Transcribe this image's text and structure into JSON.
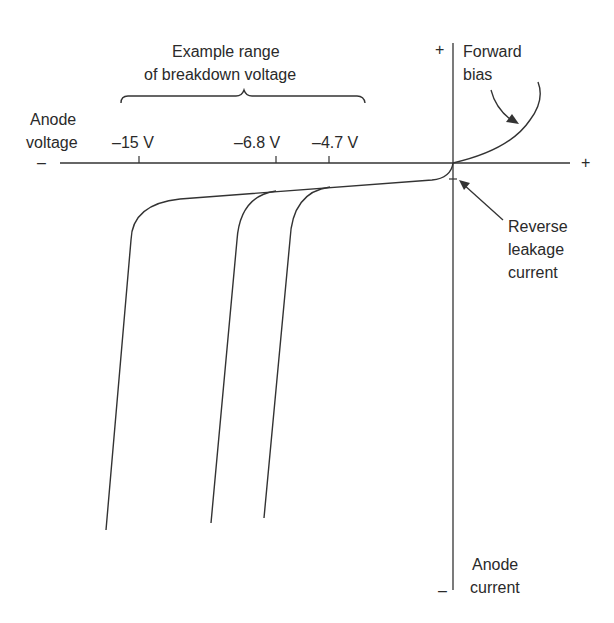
{
  "diagram": {
    "range_label": [
      "Example range",
      "of breakdown voltage"
    ],
    "x_axis": {
      "label": [
        "Anode",
        "voltage"
      ],
      "neg_sign": "–",
      "pos_sign": "+",
      "ticks": [
        {
          "label": "–15 V",
          "value": -15
        },
        {
          "label": "–6.8 V",
          "value": -6.8
        },
        {
          "label": "–4.7 V",
          "value": -4.7
        }
      ]
    },
    "y_axis": {
      "label": [
        "Anode",
        "current"
      ],
      "pos_sign": "+",
      "neg_sign": "–"
    },
    "annotations": {
      "forward_bias": [
        "Forward",
        "bias"
      ],
      "reverse_leakage": [
        "Reverse",
        "leakage",
        "current"
      ]
    },
    "curves": [
      {
        "name": "breakdown-15V",
        "breakdown_voltage": -15
      },
      {
        "name": "breakdown-6.8V",
        "breakdown_voltage": -6.8
      },
      {
        "name": "breakdown-4.7V",
        "breakdown_voltage": -4.7
      }
    ],
    "colors": {
      "line": "#333333",
      "background": "#ffffff"
    }
  }
}
